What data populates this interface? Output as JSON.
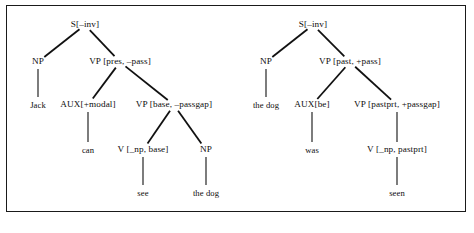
{
  "figure": {
    "kind": "syntax-tree-diagram",
    "frame": {
      "border_color": "#1a1a1a",
      "shadow_color": "#8d8d8d"
    },
    "edge_color": "#111111"
  },
  "trees": [
    {
      "id": "tree-active",
      "nodes": [
        {
          "id": "s1",
          "label": "S[–inv]",
          "x": 85,
          "y": 25
        },
        {
          "id": "np1",
          "label": "NP",
          "x": 38,
          "y": 62
        },
        {
          "id": "vp1",
          "label": "VP [pres, –pass]",
          "x": 120,
          "y": 62
        },
        {
          "id": "jack",
          "label": "Jack",
          "x": 38,
          "y": 105,
          "leaf": true
        },
        {
          "id": "aux1",
          "label": "AUX[+modal]",
          "x": 88,
          "y": 105
        },
        {
          "id": "vp2",
          "label": "VP [base, –passgap]",
          "x": 174,
          "y": 105
        },
        {
          "id": "can",
          "label": "can",
          "x": 88,
          "y": 150,
          "leaf": true
        },
        {
          "id": "v1",
          "label": "V [_np, base]",
          "x": 143,
          "y": 150
        },
        {
          "id": "np2",
          "label": "NP",
          "x": 206,
          "y": 150
        },
        {
          "id": "see",
          "label": "see",
          "x": 143,
          "y": 193,
          "leaf": true
        },
        {
          "id": "thedog1",
          "label": "the dog",
          "x": 206,
          "y": 193,
          "leaf": true
        }
      ],
      "edges": [
        {
          "from": "s1",
          "to": "np1"
        },
        {
          "from": "s1",
          "to": "vp1"
        },
        {
          "from": "np1",
          "to": "jack"
        },
        {
          "from": "vp1",
          "to": "aux1"
        },
        {
          "from": "vp1",
          "to": "vp2"
        },
        {
          "from": "aux1",
          "to": "can"
        },
        {
          "from": "vp2",
          "to": "v1"
        },
        {
          "from": "vp2",
          "to": "np2"
        },
        {
          "from": "v1",
          "to": "see"
        },
        {
          "from": "np2",
          "to": "thedog1"
        }
      ]
    },
    {
      "id": "tree-passive",
      "nodes": [
        {
          "id": "s2",
          "label": "S[–inv]",
          "x": 313,
          "y": 25
        },
        {
          "id": "np3",
          "label": "NP",
          "x": 266,
          "y": 62
        },
        {
          "id": "vp3",
          "label": "VP [past, +pass]",
          "x": 350,
          "y": 62
        },
        {
          "id": "thedog2",
          "label": "the dog",
          "x": 266,
          "y": 105,
          "leaf": true
        },
        {
          "id": "aux2",
          "label": "AUX[be]",
          "x": 312,
          "y": 105
        },
        {
          "id": "vp4",
          "label": "VP [pastprt, +passgap]",
          "x": 397,
          "y": 105
        },
        {
          "id": "was",
          "label": "was",
          "x": 312,
          "y": 150,
          "leaf": true
        },
        {
          "id": "v2",
          "label": "V [_np, pastprt]",
          "x": 397,
          "y": 150
        },
        {
          "id": "seen",
          "label": "seen",
          "x": 397,
          "y": 193,
          "leaf": true
        }
      ],
      "edges": [
        {
          "from": "s2",
          "to": "np3"
        },
        {
          "from": "s2",
          "to": "vp3"
        },
        {
          "from": "np3",
          "to": "thedog2"
        },
        {
          "from": "vp3",
          "to": "aux2"
        },
        {
          "from": "vp3",
          "to": "vp4"
        },
        {
          "from": "aux2",
          "to": "was"
        },
        {
          "from": "vp4",
          "to": "v2"
        },
        {
          "from": "v2",
          "to": "seen"
        }
      ]
    }
  ]
}
